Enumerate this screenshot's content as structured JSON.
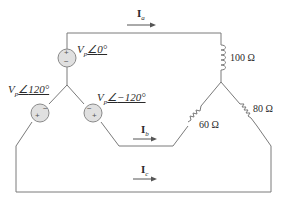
{
  "diagram": {
    "type": "three-phase wye-wye circuit",
    "sources": [
      {
        "id": "va",
        "magnitude_symbol": "V",
        "subscript": "p",
        "angle": "0°",
        "label": "Vp∠0°",
        "polarity_top": "+",
        "polarity_bottom": "−"
      },
      {
        "id": "vb",
        "magnitude_symbol": "V",
        "subscript": "p",
        "angle": "120°",
        "label": "Vp∠120°",
        "polarity_left": "+",
        "polarity_right": "−"
      },
      {
        "id": "vc",
        "magnitude_symbol": "V",
        "subscript": "p",
        "angle": "−120°",
        "label": "Vp∠−120°",
        "polarity_left": "−",
        "polarity_right": "+"
      }
    ],
    "loads": [
      {
        "id": "z_a",
        "type": "inductor",
        "value": "100 Ω"
      },
      {
        "id": "z_b",
        "type": "resistor",
        "value": "60 Ω"
      },
      {
        "id": "z_c",
        "type": "resistor",
        "value": "80 Ω"
      }
    ],
    "currents": [
      {
        "id": "ia",
        "symbol": "I",
        "subscript": "a",
        "direction": "right"
      },
      {
        "id": "ib",
        "symbol": "I",
        "subscript": "b",
        "direction": "right"
      },
      {
        "id": "ic",
        "symbol": "I",
        "subscript": "c",
        "direction": "right"
      }
    ],
    "colors": {
      "wire": "#7a7a7a",
      "source_fill": "#e0e0e0",
      "text": "#2a2a2a"
    }
  }
}
